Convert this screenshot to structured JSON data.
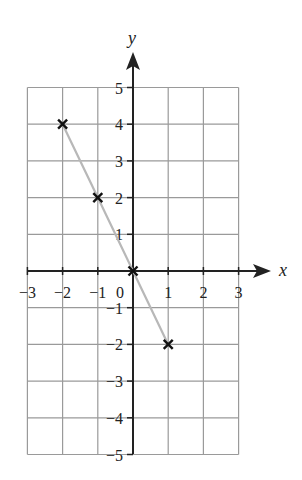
{
  "chart_data": {
    "type": "line",
    "title": "",
    "xlabel": "x",
    "ylabel": "y",
    "xlim": [
      -3,
      3
    ],
    "ylim": [
      -5,
      5
    ],
    "grid": true,
    "legend": null,
    "x_ticks": [
      -3,
      -2,
      -1,
      1,
      2,
      3
    ],
    "x_tick_labels": [
      "−3",
      "−2",
      "−1",
      "1",
      "2",
      "3"
    ],
    "y_ticks": [
      5,
      4,
      3,
      2,
      1,
      -1,
      -2,
      -3,
      -4,
      -5
    ],
    "y_tick_labels": [
      "5",
      "4",
      "3",
      "2",
      "1",
      "−1",
      "−2",
      "−3",
      "−4",
      "−5"
    ],
    "origin_label": "0",
    "series": [
      {
        "name": "line",
        "x": [
          -2,
          -1,
          0,
          1
        ],
        "y": [
          4,
          2,
          0,
          -2
        ],
        "marker": "x",
        "line_color": "#b8b8b8",
        "marker_color": "#111111"
      }
    ]
  },
  "colors": {
    "grid": "#9a9a9a",
    "axis": "#222222",
    "line": "#b8b8b8",
    "marker": "#111111"
  }
}
